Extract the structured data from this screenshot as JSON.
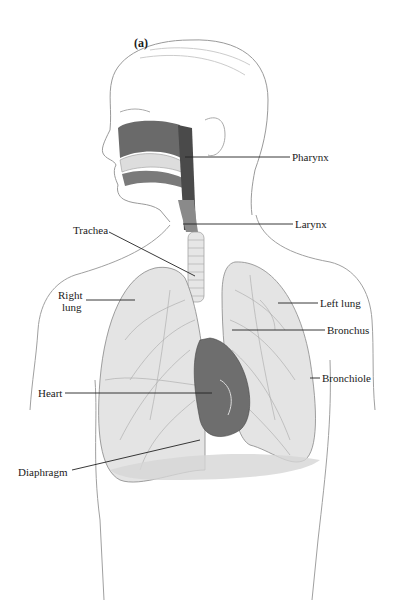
{
  "figure": {
    "panel_label": "(a)",
    "labels": {
      "pharynx": "Pharynx",
      "larynx": "Larynx",
      "trachea": "Trachea",
      "right_lung_line1": "Right",
      "right_lung_line2": "lung",
      "left_lung": "Left lung",
      "bronchus": "Bronchus",
      "bronchiole": "Bronchiole",
      "heart": "Heart",
      "diaphragm": "Diaphragm"
    },
    "colors": {
      "outline": "#9a9a9a",
      "lung_fill": "#e4e4e4",
      "airway_dark": "#555555",
      "heart_fill": "#6e6e6e",
      "leader_line": "#222222"
    }
  }
}
